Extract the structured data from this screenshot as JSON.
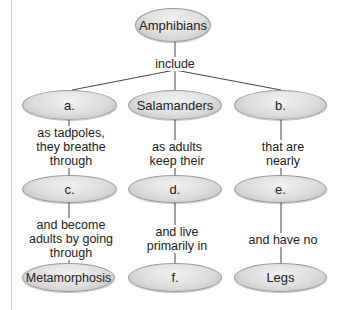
{
  "diagram": {
    "type": "concept-map",
    "root": {
      "label": "Amphibians"
    },
    "root_link": "include",
    "columns": [
      {
        "node1": "a.",
        "link1": "as tadpoles, they breathe through",
        "link1_lines": [
          "as tadpoles,",
          "they breathe",
          "through"
        ],
        "node2": "c.",
        "link2": "and become adults by going through",
        "link2_lines": [
          "and become",
          "adults by going",
          "through"
        ],
        "node3": "Metamorphosis"
      },
      {
        "node1": "Salamanders",
        "link1": "as adults keep their",
        "link1_lines": [
          "as adults",
          "keep their"
        ],
        "node2": "d.",
        "link2": "and live primarily in",
        "link2_lines": [
          "and live",
          "primarily in"
        ],
        "node3": "f."
      },
      {
        "node1": "b.",
        "link1": "that are nearly",
        "link1_lines": [
          "that are",
          "nearly"
        ],
        "node2": "e.",
        "link2": "and have no",
        "link2_lines": [
          "and have no"
        ],
        "node3": "Legs"
      }
    ],
    "colors": {
      "node_fill": "#dcdcdc",
      "node_border": "#9a9a9a",
      "line": "#444444"
    }
  }
}
